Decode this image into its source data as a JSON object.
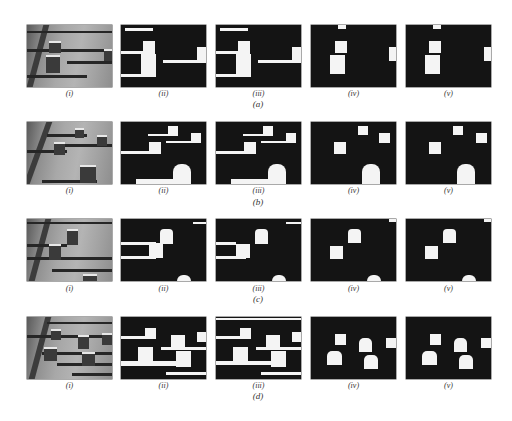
{
  "figure": {
    "rows": [
      {
        "id": "a",
        "caption": "(a)"
      },
      {
        "id": "b",
        "caption": "(b)"
      },
      {
        "id": "c",
        "caption": "(c)"
      },
      {
        "id": "d",
        "caption": "(d)"
      }
    ],
    "column_labels": [
      "(i)",
      "(ii)",
      "(iii)",
      "(iv)",
      "(v)"
    ]
  },
  "colors": {
    "background": "#ffffff",
    "mask_bg": "#141414",
    "foreground": "#f4f4f4",
    "label_text": "#333333"
  }
}
